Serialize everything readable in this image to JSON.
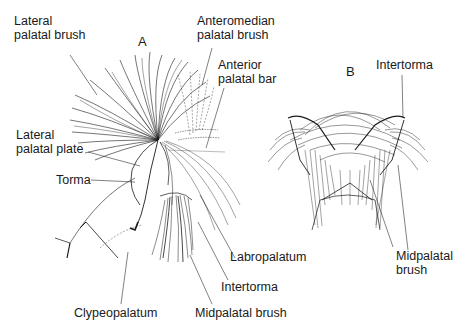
{
  "figure": {
    "panels": [
      {
        "id": "A",
        "label": "A"
      },
      {
        "id": "B",
        "label": "B"
      }
    ],
    "labels_A": {
      "lateral_palatal_brush": "Lateral\npalatal brush",
      "anteromedian_palatal_brush": "Anteromedian\npalatal brush",
      "anterior_palatal_bar": "Anterior\npalatal bar",
      "lateral_palatal_plate": "Lateral\npalatal plate",
      "torma": "Torma",
      "labropalatum": "Labropalatum",
      "intertorma": "Intertorma",
      "clypeopalatum": "Clypeopalatum",
      "midpalatal_brush": "Midpalatal brush"
    },
    "labels_B": {
      "intertorma": "Intertorma",
      "midpalatal_brush": "Midpalatal\nbrush"
    },
    "colors": {
      "ink": "#1a1a1a",
      "background": "#ffffff"
    }
  }
}
